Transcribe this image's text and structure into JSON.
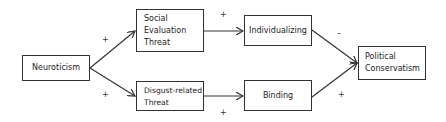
{
  "diagram": {
    "type": "path-model",
    "nodes": [
      {
        "id": "neuroticism",
        "label": "Neuroticism"
      },
      {
        "id": "social_eval",
        "label_lines": [
          "Social",
          "Evaluation",
          "Threat"
        ]
      },
      {
        "id": "disgust",
        "label_lines": [
          "Disgust-related",
          "Threat"
        ]
      },
      {
        "id": "individualizing",
        "label": "Individualizing"
      },
      {
        "id": "binding",
        "label": "Binding"
      },
      {
        "id": "conservatism",
        "label_lines": [
          "Political",
          "Conservatism"
        ]
      }
    ],
    "edges": [
      {
        "from": "neuroticism",
        "to": "social_eval",
        "sign": "+"
      },
      {
        "from": "neuroticism",
        "to": "disgust",
        "sign": "+"
      },
      {
        "from": "social_eval",
        "to": "individualizing",
        "sign": "+"
      },
      {
        "from": "disgust",
        "to": "binding",
        "sign": "+"
      },
      {
        "from": "individualizing",
        "to": "conservatism",
        "sign": "–"
      },
      {
        "from": "binding",
        "to": "conservatism",
        "sign": "+"
      }
    ]
  }
}
